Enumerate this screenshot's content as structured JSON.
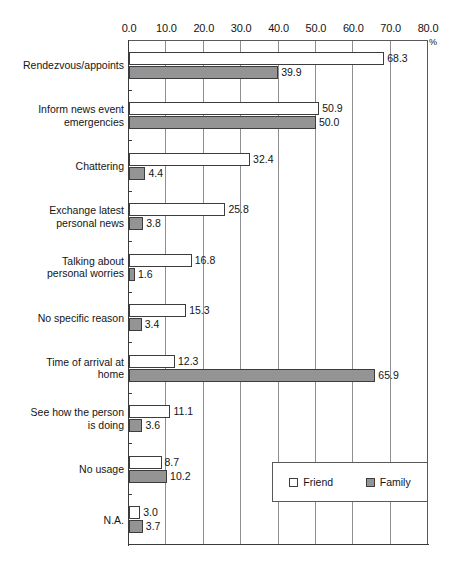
{
  "chart_data": {
    "type": "bar",
    "orientation": "horizontal",
    "title": "",
    "subtitle": "",
    "xlabel": "%",
    "ylabel": "",
    "xlim": [
      0.0,
      80.0
    ],
    "xticks": [
      "0.0",
      "10.0",
      "20.0",
      "30.0",
      "40.0",
      "50.0",
      "60.0",
      "70.0",
      "80.0"
    ],
    "xtick_values": [
      0,
      10,
      20,
      30,
      40,
      50,
      60,
      70,
      80
    ],
    "grid": "vertical",
    "legend_position": "inside-bottom-right",
    "categories": [
      "Rendezvous/appoints",
      "Inform news event\nemergencies",
      "Chattering",
      "Exchange latest\npersonal news",
      "Talking about\npersonal worries",
      "No specific reason",
      "Time of arrival at\nhome",
      "See how the person\nis doing",
      "No usage",
      "N.A."
    ],
    "series": [
      {
        "name": "Friend",
        "color": "#ffffff",
        "values": [
          68.3,
          50.9,
          32.4,
          25.8,
          16.8,
          15.3,
          12.3,
          11.1,
          8.7,
          3.0
        ],
        "labels": [
          "68.3",
          "50.9",
          "32.4",
          "25.8",
          "16.8",
          "15.3",
          "12.3",
          "11.1",
          "8.7",
          "3.0"
        ]
      },
      {
        "name": "Family",
        "color": "#949494",
        "values": [
          39.9,
          50.0,
          4.4,
          3.8,
          1.6,
          3.4,
          65.9,
          3.6,
          10.2,
          3.7
        ],
        "labels": [
          "39.9",
          "50.0",
          "4.4",
          "3.8",
          "1.6",
          "3.4",
          "65.9",
          "3.6",
          "10.2",
          "3.7"
        ]
      }
    ]
  },
  "legend": {
    "entries": [
      {
        "label": "Friend",
        "swatch": "friend"
      },
      {
        "label": "Family",
        "swatch": "family"
      }
    ]
  }
}
